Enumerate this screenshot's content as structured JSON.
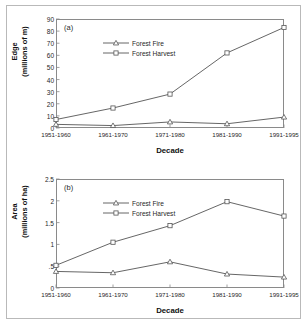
{
  "figure": {
    "background": "#ffffff",
    "border_color": "#b9b9b9",
    "line_color": "#555555",
    "axis_color": "#8a8a8a"
  },
  "xaxis": {
    "title": "Decade",
    "categories": [
      "1951-1960",
      "1961-1970",
      "1971-1980",
      "1981-1990",
      "1991-1995"
    ]
  },
  "panel_a": {
    "label": "(a)",
    "ylabel_line1": "Edge",
    "ylabel_line2": "(millions of m)",
    "yticks": [
      "0",
      "10",
      "20",
      "30",
      "40",
      "50",
      "60",
      "70",
      "80",
      "90"
    ],
    "legend": [
      {
        "name": "Forest Fire",
        "marker": "triangle"
      },
      {
        "name": "Forest Harvest",
        "marker": "square"
      }
    ]
  },
  "panel_b": {
    "label": "(b)",
    "ylabel_line1": "Area",
    "ylabel_line2": "(millions of ha)",
    "yticks": [
      "0",
      ".5",
      "1",
      "1.5",
      "2",
      "2.5"
    ],
    "legend": [
      {
        "name": "Forest Fire",
        "marker": "triangle"
      },
      {
        "name": "Forest Harvest",
        "marker": "square"
      }
    ]
  },
  "chart_data": [
    {
      "type": "line",
      "panel": "(a)",
      "title": "Edge created by forest fire and forest harvest by decade",
      "xlabel": "Decade",
      "ylabel": "Edge (millions of m)",
      "categories": [
        "1951-1960",
        "1961-1970",
        "1971-1980",
        "1981-1990",
        "1991-1995"
      ],
      "ylim": [
        0,
        90
      ],
      "ytick_step": 10,
      "grid": false,
      "legend_position": "upper-left-inside",
      "series": [
        {
          "name": "Forest Fire",
          "marker": "triangle",
          "values": [
            3.0,
            2.0,
            5.0,
            3.5,
            9.0
          ]
        },
        {
          "name": "Forest Harvest",
          "marker": "square",
          "values": [
            7.0,
            16.5,
            28.0,
            62.0,
            83.0
          ]
        }
      ]
    },
    {
      "type": "line",
      "panel": "(b)",
      "title": "Area disturbed by forest fire and forest harvest by decade",
      "xlabel": "Decade",
      "ylabel": "Area (millions of ha)",
      "categories": [
        "1951-1960",
        "1961-1970",
        "1971-1980",
        "1981-1990",
        "1991-1995"
      ],
      "ylim": [
        0,
        2.5
      ],
      "ytick_step": 0.5,
      "grid": false,
      "legend_position": "upper-left-inside",
      "series": [
        {
          "name": "Forest Fire",
          "marker": "triangle",
          "values": [
            0.38,
            0.35,
            0.6,
            0.32,
            0.25
          ]
        },
        {
          "name": "Forest Harvest",
          "marker": "square",
          "values": [
            0.52,
            1.05,
            1.43,
            1.98,
            1.65
          ]
        }
      ]
    }
  ]
}
